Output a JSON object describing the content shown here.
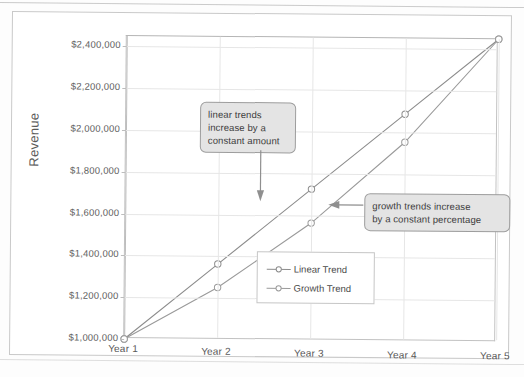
{
  "chart_data": {
    "type": "line",
    "title": "",
    "xlabel": "",
    "ylabel": "Revenue",
    "categories": [
      "Year 1",
      "Year 2",
      "Year 3",
      "Year 4",
      "Year 5"
    ],
    "x": [
      1,
      2,
      3,
      4,
      5
    ],
    "series": [
      {
        "name": "Linear Trend",
        "values": [
          1000000,
          1362500,
          1725000,
          2087500,
          2450000
        ]
      },
      {
        "name": "Growth Trend",
        "values": [
          1000000,
          1250000,
          1562500,
          1953000,
          2450000
        ]
      }
    ],
    "ylim": [
      1000000,
      2450000
    ],
    "yticks": [
      1000000,
      1200000,
      1400000,
      1600000,
      1800000,
      2000000,
      2200000,
      2400000
    ],
    "ytick_labels": [
      "$1,000,000",
      "$1,200,000",
      "$1,400,000",
      "$1,600,000",
      "$1,800,000",
      "$2,000,000",
      "$2,200,000",
      "$2,400,000"
    ],
    "xtick_labels": [
      "Year 1",
      "Year 2",
      "Year 3",
      "Year 4",
      "Year 5"
    ],
    "grid": true,
    "legend_position": "inside-bottom-right",
    "marker": "open-circle",
    "annotations": [
      {
        "id": "linear-callout",
        "text": "linear trends increase by a constant amount",
        "lines": [
          "linear trends",
          "increase by a",
          "constant amount"
        ],
        "arrow_direction": "down",
        "points_to_series": "Linear Trend"
      },
      {
        "id": "growth-callout",
        "text": "growth trends increase by a constant percentage",
        "lines": [
          "growth trends increase",
          "by a constant percentage"
        ],
        "arrow_direction": "left",
        "points_to_series": "Growth Trend"
      }
    ],
    "colors": {
      "linear_trend_line": "#8c8c8c",
      "growth_trend_line": "#9a9a9a",
      "gridline": "#e6e6e6",
      "axis": "#bdbdbd",
      "plot_background": "#ffffff",
      "callout_background": "#e4e4e4",
      "callout_border": "#9d9d9d",
      "text": "#595959"
    }
  },
  "legend": {
    "items": [
      {
        "label": "Linear Trend"
      },
      {
        "label": "Growth Trend"
      }
    ]
  },
  "axis": {
    "y_title": "Revenue"
  },
  "callouts": {
    "linear": {
      "line1": "linear trends",
      "line2": "increase by a",
      "line3": "constant amount"
    },
    "growth": {
      "line1": "growth trends increase",
      "line2": "by a constant percentage"
    }
  }
}
